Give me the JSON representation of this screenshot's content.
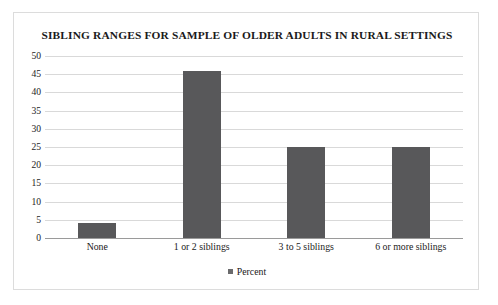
{
  "figure": {
    "background_color": "#ffffff",
    "frame_border_color": "#dcdcdc"
  },
  "chart_data": {
    "type": "bar",
    "title": "SIBLING RANGES FOR SAMPLE OF OLDER ADULTS IN RURAL SETTINGS",
    "xlabel": "",
    "ylabel": "",
    "categories": [
      "None",
      "1 or 2 siblings",
      "3 to 5 siblings",
      "6 or more siblings"
    ],
    "series": [
      {
        "name": "Percent",
        "values": [
          4,
          46,
          25,
          25
        ],
        "color": "#58585a"
      }
    ],
    "ylim": [
      0,
      50
    ],
    "ytick_step": 5,
    "yticks": [
      50,
      45,
      40,
      35,
      30,
      25,
      20,
      15,
      10,
      5,
      0
    ],
    "grid": true,
    "grid_axis": "y",
    "grid_color": "#d9d9d9",
    "axis_line_color": "#9a9a9a",
    "legend_position": "bottom",
    "legend_entries": [
      "Percent"
    ]
  }
}
